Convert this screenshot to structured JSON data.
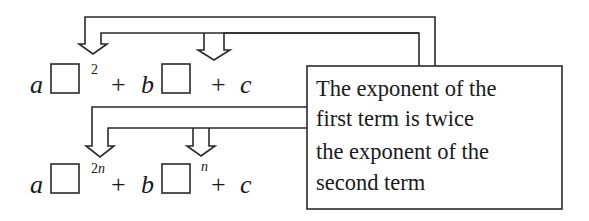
{
  "expression_top": {
    "coef_a": "a",
    "exponent_1": "2",
    "plus_1": "+",
    "coef_b": "b",
    "plus_2": "+",
    "const_c": "c"
  },
  "expression_bottom": {
    "coef_a": "a",
    "exponent_1_num": "2",
    "exponent_1_var": "n",
    "plus_1": "+",
    "coef_b": "b",
    "exponent_2": "n",
    "plus_2": "+",
    "const_c": "c"
  },
  "note": {
    "lines": [
      "The exponent of the",
      "first term is twice",
      "the exponent of the",
      "second term"
    ]
  }
}
